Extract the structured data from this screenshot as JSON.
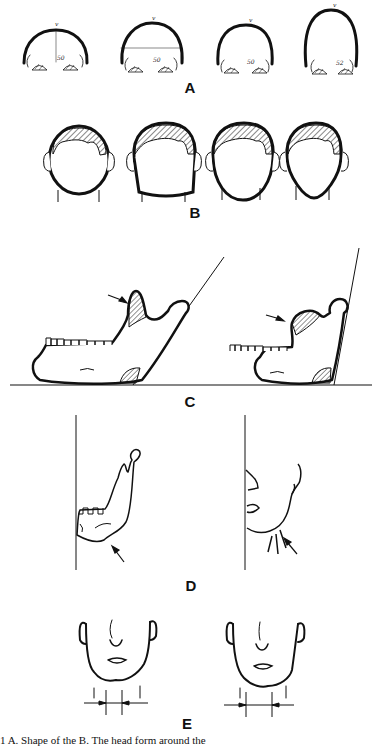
{
  "figure": {
    "panels": [
      {
        "id": "A",
        "label": "A",
        "description": "Vertex contour of four head shapes viewed from behind",
        "annotations": [
          {
            "vertex_mark": "v",
            "value": "50"
          },
          {
            "vertex_mark": "v",
            "value": "50"
          },
          {
            "vertex_mark": "v",
            "value": "50"
          },
          {
            "vertex_mark": "v",
            "value": "52"
          }
        ]
      },
      {
        "id": "B",
        "label": "B",
        "description": "Four head forms (round, square, oval, tapered) with hatched hair region"
      },
      {
        "id": "C",
        "label": "C",
        "description": "Lateral mandible views with tangent line to ramus; arrows point to coronoid process"
      },
      {
        "id": "D",
        "label": "D",
        "description": "Mandible and profile beside vertical reference line; arrows at angle of jaw"
      },
      {
        "id": "E",
        "label": "E",
        "description": "Frontal views of lower face and neck with width measurement arrows"
      }
    ],
    "caption": "1   A. Shape of the                                   B. The head form                    around the"
  }
}
